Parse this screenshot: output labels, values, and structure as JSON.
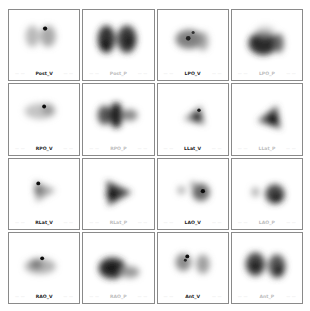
{
  "figure": {
    "layout": {
      "rows": 4,
      "columns": 4
    },
    "panels": [
      {
        "label": "Post_V",
        "type": "V",
        "left_tick": "— —",
        "right_tick": "— —"
      },
      {
        "label": "Post_P",
        "type": "P",
        "left_tick": "— —",
        "right_tick": "— —"
      },
      {
        "label": "LPO_V",
        "type": "V",
        "left_tick": "— —",
        "right_tick": "— —"
      },
      {
        "label": "LPO_P",
        "type": "P",
        "left_tick": "— —",
        "right_tick": "— —"
      },
      {
        "label": "RPO_V",
        "type": "V",
        "left_tick": "— —",
        "right_tick": "— —"
      },
      {
        "label": "RPO_P",
        "type": "P",
        "left_tick": "— —",
        "right_tick": "— —"
      },
      {
        "label": "LLat_V",
        "type": "V",
        "left_tick": "— —",
        "right_tick": "— —"
      },
      {
        "label": "LLat_P",
        "type": "P",
        "left_tick": "— —",
        "right_tick": "— —"
      },
      {
        "label": "RLat_V",
        "type": "V",
        "left_tick": "— —",
        "right_tick": "— —"
      },
      {
        "label": "RLat_P",
        "type": "P",
        "left_tick": "— —",
        "right_tick": "— —"
      },
      {
        "label": "LAO_V",
        "type": "V",
        "left_tick": "— —",
        "right_tick": "— —"
      },
      {
        "label": "LAO_P",
        "type": "P",
        "left_tick": "— —",
        "right_tick": "— —"
      },
      {
        "label": "RAO_V",
        "type": "V",
        "left_tick": "— —",
        "right_tick": "— —"
      },
      {
        "label": "RAO_P",
        "type": "P",
        "left_tick": "— —",
        "right_tick": "— —"
      },
      {
        "label": "Ant_V",
        "type": "V",
        "left_tick": "— —",
        "right_tick": "— —"
      },
      {
        "label": "Ant_P",
        "type": "P",
        "left_tick": "— —",
        "right_tick": "— —"
      }
    ]
  }
}
